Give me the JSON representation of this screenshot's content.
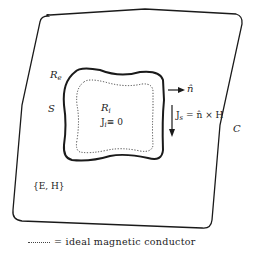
{
  "figure": {
    "region_outer_label": "C",
    "surface_label": "S",
    "exterior_region_label": "R",
    "exterior_region_sub": "e",
    "interior_region_label": "R",
    "interior_region_sub": "i",
    "interior_current_label": "J",
    "interior_current_sub": "i",
    "interior_current_eq": "≡ 0",
    "normal_label": "n̂",
    "surface_current_label": "J",
    "surface_current_sub": "s",
    "surface_current_eq": "= n̂ × H",
    "fields_label": "{E,  H}"
  },
  "legend": {
    "symbol": "dotted-line",
    "text": "= ideal magnetic conductor"
  },
  "colors": {
    "line": "#1a1a1a",
    "background": "#ffffff"
  }
}
